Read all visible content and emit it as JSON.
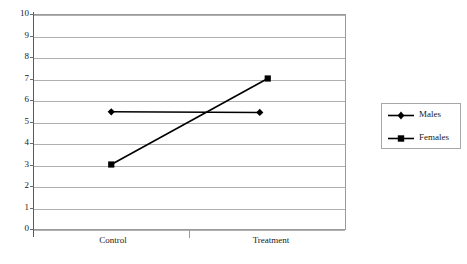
{
  "chart_data": {
    "type": "line",
    "title": "",
    "xlabel": "",
    "ylabel": "",
    "categories": [
      "Control",
      "Treatment"
    ],
    "ylim": [
      0,
      10
    ],
    "yticks": [
      "0",
      "1",
      "2",
      "3",
      "4",
      "5",
      "6",
      "7",
      "8",
      "9",
      "10"
    ],
    "grid": true,
    "legend_position": "right",
    "series": [
      {
        "name": "Males",
        "marker": "diamond",
        "color": "#000000",
        "values": [
          5.45,
          5.42
        ]
      },
      {
        "name": "Females",
        "marker": "square",
        "color": "#000000",
        "values": [
          3.0,
          7.0
        ]
      }
    ]
  },
  "legend": {
    "entries": [
      {
        "label": "Males",
        "marker": "diamond-marker-icon"
      },
      {
        "label": "Females",
        "marker": "square-marker-icon"
      }
    ]
  }
}
